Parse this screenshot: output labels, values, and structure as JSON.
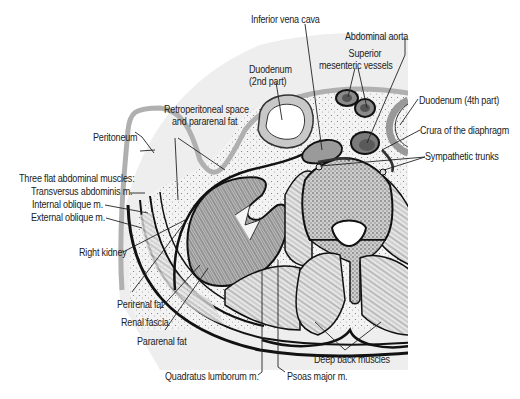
{
  "figure": {
    "labels": {
      "inferior_vena_cava": "Inferior vena cava",
      "abdominal_aorta": "Abdominal aorta",
      "superior_mesenteric_1": "Superior",
      "superior_mesenteric_2": "mesenteric vessels",
      "duodenum_2nd_1": "Duodenum",
      "duodenum_2nd_2": "(2nd part)",
      "duodenum_4th": "Duodenum (4th part)",
      "crura": "Crura of the diaphragm",
      "sympathetic_trunks": "Sympathetic trunks",
      "retroperitoneal_1": "Retroperitoneal space",
      "retroperitoneal_2": "and pararenal fat",
      "peritoneum": "Peritoneum",
      "three_flat": "Three flat abdominal muscles:",
      "transversus": "Transversus abdominis m.",
      "internal_oblique": "Internal oblique m.",
      "external_oblique": "External oblique m.",
      "right_kidney": "Right kidney",
      "perirenal_fat": "Perirenal fat",
      "renal_fascia": "Renal fascia",
      "pararenal_fat": "Pararenal fat",
      "quadratus_lumborum": "Quadratus lumborum m.",
      "psoas_major": "Psoas major m.",
      "deep_back_muscles": "Deep back muscles"
    },
    "colors": {
      "outline": "#111111",
      "peritoneum": "#b5b5b5",
      "cavity_fill": "#ececec",
      "fat_fill": "#f2f2f2",
      "vessel_fill": "#8a8a8a",
      "muscle_fill": "#d8d8d8"
    }
  }
}
